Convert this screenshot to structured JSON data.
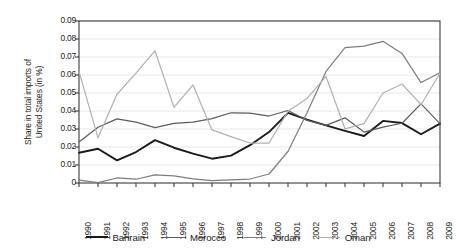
{
  "chart_data": {
    "type": "line",
    "title": "",
    "subtitle": "",
    "xlabel": "",
    "ylabel": "Share in total imports of United States (in %)",
    "ylabel_line1": "Share in total imports of",
    "ylabel_line2": "United States (in %)",
    "categories": [
      "1990",
      "1991",
      "1992",
      "1993",
      "1994",
      "1995",
      "1996",
      "1997",
      "1998",
      "1999",
      "2000",
      "2001",
      "2002",
      "2003",
      "2004",
      "2005",
      "2006",
      "2007",
      "2008",
      "2009"
    ],
    "ylim": [
      0,
      0.09
    ],
    "yticks": [
      "0.09",
      "0.08",
      "0.07",
      "0.06",
      "0.05",
      "0.04",
      "0.03",
      "0.02",
      "0.01",
      "0"
    ],
    "ytick_values": [
      0.09,
      0.08,
      0.07,
      0.06,
      0.05,
      0.04,
      0.03,
      0.02,
      0.01,
      0
    ],
    "grid": true,
    "grid_axis": "y",
    "legend_position": "bottom",
    "series": [
      {
        "name": "Bahrain",
        "color": "#1a1a1a",
        "width": 1.9,
        "values": [
          0.0168,
          0.019,
          0.0126,
          0.0172,
          0.0238,
          0.0196,
          0.0163,
          0.0135,
          0.0152,
          0.021,
          0.0283,
          0.039,
          0.0352,
          0.032,
          0.029,
          0.0261,
          0.0345,
          0.0333,
          0.0271,
          0.033
        ]
      },
      {
        "name": "Morocco",
        "color": "#5c5c5c",
        "width": 1.2,
        "values": [
          0.0228,
          0.031,
          0.0356,
          0.0338,
          0.0308,
          0.0331,
          0.0338,
          0.0358,
          0.039,
          0.0388,
          0.0372,
          0.0403,
          0.0348,
          0.032,
          0.0362,
          0.0283,
          0.031,
          0.0332,
          0.044,
          0.033
        ]
      },
      {
        "name": "Jordan",
        "color": "#7d7d7d",
        "width": 1.2,
        "values": [
          0.0016,
          0.0002,
          0.0028,
          0.0021,
          0.0045,
          0.004,
          0.0023,
          0.0013,
          0.0017,
          0.0022,
          0.005,
          0.0175,
          0.039,
          0.062,
          0.0752,
          0.076,
          0.0787,
          0.072,
          0.0558,
          0.0612
        ]
      },
      {
        "name": "Oman",
        "color": "#b0b0b0",
        "width": 1.2,
        "values": [
          0.062,
          0.0251,
          0.0493,
          0.061,
          0.0735,
          0.042,
          0.0545,
          0.0295,
          0.0258,
          0.0222,
          0.0222,
          0.0398,
          0.047,
          0.0592,
          0.0301,
          0.033,
          0.05,
          0.055,
          0.0435,
          0.061
        ]
      }
    ]
  },
  "legend": {
    "items": [
      {
        "label": "Bahrain",
        "color": "#1a1a1a",
        "width": 2.1
      },
      {
        "label": "Morocco",
        "color": "#5c5c5c",
        "width": 1.5
      },
      {
        "label": "Jordan",
        "color": "#7d7d7d",
        "width": 1.5
      },
      {
        "label": "Oman",
        "color": "#b0b0b0",
        "width": 1.5
      }
    ]
  },
  "axes": {
    "plot_left": 79,
    "plot_right": 440,
    "plot_top": 21,
    "plot_bottom": 183,
    "frame_color": "#3b3b3b",
    "grid_color": "#e6e6ec"
  }
}
